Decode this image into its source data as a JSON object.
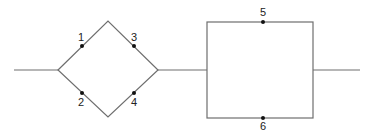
{
  "diagram": {
    "type": "reliability-block-network",
    "colors": {
      "line": "#6e6e6e",
      "node": "#111111",
      "label": "#222222",
      "background": "#ffffff"
    },
    "lines": {
      "input": {
        "x1": 14,
        "y1": 70,
        "x2": 58,
        "y2": 70
      },
      "bridge": {
        "x1": 158,
        "y1": 70,
        "x2": 207,
        "y2": 70
      },
      "output": {
        "x1": 313,
        "y1": 70,
        "x2": 360,
        "y2": 70
      }
    },
    "diamond": {
      "left": [
        58,
        70
      ],
      "top": [
        108,
        21
      ],
      "right": [
        158,
        70
      ],
      "bottom": [
        108,
        117
      ]
    },
    "rectangle": {
      "x": 207,
      "y": 22,
      "width": 106,
      "height": 96
    },
    "nodes": [
      {
        "id": "1",
        "label": "1",
        "cx": 82,
        "cy": 46,
        "lx": 81,
        "ly": 41
      },
      {
        "id": "2",
        "label": "2",
        "cx": 82,
        "cy": 93,
        "lx": 81,
        "ly": 106
      },
      {
        "id": "3",
        "label": "3",
        "cx": 134,
        "cy": 46,
        "lx": 134,
        "ly": 41
      },
      {
        "id": "4",
        "label": "4",
        "cx": 134,
        "cy": 93,
        "lx": 134,
        "ly": 106
      },
      {
        "id": "5",
        "label": "5",
        "cx": 263,
        "cy": 22,
        "lx": 263,
        "ly": 16
      },
      {
        "id": "6",
        "label": "6",
        "cx": 263,
        "cy": 118,
        "lx": 263,
        "ly": 130
      }
    ]
  }
}
